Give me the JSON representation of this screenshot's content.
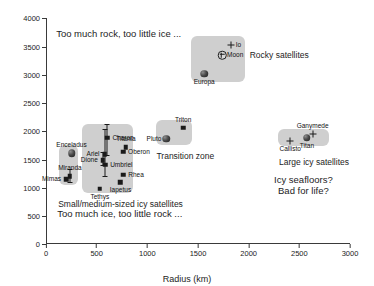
{
  "chart_data": {
    "type": "scatter",
    "title": "",
    "xlabel": "Radius (km)",
    "ylabel": "Density (kg m",
    "ylabel_sup": "-3",
    "ylabel_tail": ")",
    "xlim": [
      0,
      3000
    ],
    "ylim": [
      0,
      4000
    ],
    "xticks": [
      0,
      500,
      1000,
      1500,
      2000,
      2500,
      3000
    ],
    "yticks": [
      0,
      500,
      1000,
      1500,
      2000,
      2500,
      3000,
      3500,
      4000
    ],
    "grid": false,
    "legend": "none",
    "points": [
      {
        "name": "Io",
        "x": 1822,
        "y": 3530,
        "marker": "plus",
        "label_pos": "right"
      },
      {
        "name": "Moon",
        "x": 1737,
        "y": 3344,
        "marker": "circleplus",
        "label_pos": "right"
      },
      {
        "name": "Europa",
        "x": 1561,
        "y": 3010,
        "marker": "sphere",
        "label_pos": "below"
      },
      {
        "name": "Triton",
        "x": 1353,
        "y": 2060,
        "marker": "square",
        "label_pos": "above"
      },
      {
        "name": "Pluto",
        "x": 1188,
        "y": 1860,
        "marker": "sphere",
        "label_pos": "left"
      },
      {
        "name": "Ganymede",
        "x": 2631,
        "y": 1940,
        "marker": "plus",
        "label_pos": "above"
      },
      {
        "name": "Titan",
        "x": 2575,
        "y": 1880,
        "marker": "sphere",
        "label_pos": "below"
      },
      {
        "name": "Callisto",
        "x": 2410,
        "y": 1830,
        "marker": "plus",
        "label_pos": "below"
      },
      {
        "name": "Charon",
        "x": 606,
        "y": 1880,
        "marker": "square",
        "err_lo": 1560,
        "err_hi": 2120,
        "label_pos": "right"
      },
      {
        "name": "Titania",
        "x": 789,
        "y": 1710,
        "marker": "square",
        "label_pos": "above"
      },
      {
        "name": "Oberon",
        "x": 761,
        "y": 1630,
        "marker": "square",
        "label_pos": "right"
      },
      {
        "name": "Dione",
        "x": 561,
        "y": 1480,
        "marker": "square",
        "err_lo": 1380,
        "err_hi": 1620,
        "label_pos": "left"
      },
      {
        "name": "Ariel",
        "x": 578,
        "y": 1590,
        "marker": "square",
        "err_lo": 1180,
        "err_hi": 2040,
        "label_pos": "left"
      },
      {
        "name": "Umbriel",
        "x": 584,
        "y": 1400,
        "marker": "square",
        "label_pos": "right"
      },
      {
        "name": "Rhea",
        "x": 763,
        "y": 1230,
        "marker": "square",
        "label_pos": "right"
      },
      {
        "name": "Iapetus",
        "x": 735,
        "y": 1090,
        "marker": "square",
        "label_pos": "below"
      },
      {
        "name": "Tethys",
        "x": 531,
        "y": 980,
        "marker": "square",
        "label_pos": "below"
      },
      {
        "name": "Enceladus",
        "x": 252,
        "y": 1610,
        "marker": "sphere",
        "label_pos": "above"
      },
      {
        "name": "Miranda",
        "x": 236,
        "y": 1200,
        "marker": "square",
        "err_lo": 1080,
        "err_hi": 1330,
        "label_pos": "above"
      },
      {
        "name": "Mimas",
        "x": 198,
        "y": 1150,
        "marker": "square",
        "label_pos": "left"
      }
    ],
    "groups": [
      {
        "name": "Rocky satellites",
        "label": "Rocky satellites"
      },
      {
        "name": "Transition zone",
        "label": "Transition zone"
      },
      {
        "name": "Large icy satellites",
        "label": "Large icy satellites"
      },
      {
        "name": "Small/medium-sized icy satellites",
        "label": "Small/medium-sized icy satellites"
      }
    ],
    "annotations": [
      {
        "name": "top-regime",
        "text": "Too much rock, too little ice ..."
      },
      {
        "name": "bottom-regime",
        "text": "Too much ice, too little rock ..."
      },
      {
        "name": "question-1",
        "text": "Icy seafloors?"
      },
      {
        "name": "question-2",
        "text": "Bad for life?"
      }
    ],
    "colors": {
      "box_fill": "#cfcfcf",
      "axis": "#3a3a3a",
      "marker": "#1a1a1a",
      "text": "#1d1d1d",
      "background": "#ffffff"
    }
  }
}
